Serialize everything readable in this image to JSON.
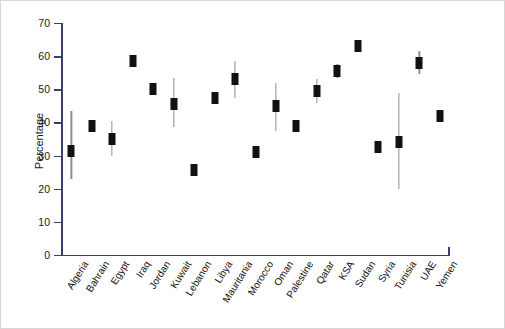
{
  "chart_data": {
    "type": "scatter",
    "title": "",
    "xlabel": "",
    "ylabel": "Percentage",
    "ylim": [
      0,
      70
    ],
    "yticks": [
      0,
      10,
      20,
      30,
      40,
      50,
      60,
      70
    ],
    "grid": false,
    "legend": false,
    "error_bars": true,
    "marker_color": "#111111",
    "errorbar_color": "#8e8e94",
    "axis_color": "#3a3f63",
    "categories": [
      "Algeria",
      "Bahrain",
      "Egypt",
      "Iraq",
      "Jordan",
      "Kuwait",
      "Lebanon",
      "Libya",
      "Mauritania",
      "Morocco",
      "Oman",
      "Palestine",
      "Qatar",
      "KSA",
      "Sudan",
      "Syria",
      "Tunisia",
      "UAE",
      "Yemen"
    ],
    "values": [
      31.5,
      39.0,
      35.0,
      58.5,
      50.0,
      45.5,
      25.5,
      47.5,
      53.0,
      31.0,
      45.0,
      39.0,
      49.5,
      55.5,
      63.0,
      32.5,
      34.0,
      58.0,
      42.0
    ],
    "ci_low": [
      23.0,
      39.0,
      30.0,
      57.0,
      49.0,
      38.5,
      25.5,
      47.5,
      47.5,
      30.0,
      37.5,
      39.0,
      46.0,
      53.5,
      63.0,
      32.5,
      20.0,
      54.5,
      40.5
    ],
    "ci_high": [
      43.5,
      39.0,
      40.5,
      60.0,
      51.0,
      53.5,
      25.5,
      47.5,
      58.5,
      32.0,
      52.0,
      39.0,
      53.0,
      57.5,
      63.0,
      32.5,
      49.0,
      61.5,
      43.5
    ]
  }
}
